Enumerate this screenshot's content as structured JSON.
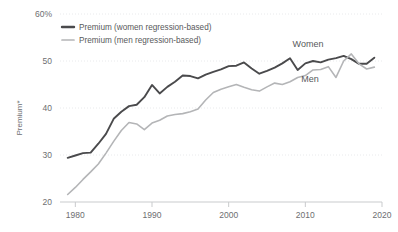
{
  "chart_data": {
    "type": "line",
    "title": "",
    "xlabel": "",
    "ylabel": "Premium*",
    "xlim": [
      1979,
      2020
    ],
    "ylim": [
      20,
      60
    ],
    "grid": true,
    "legend_position": "top-left",
    "y_ticks": [
      "60%",
      "50",
      "40",
      "30",
      "20"
    ],
    "y_tick_values": [
      60,
      50,
      40,
      30,
      20
    ],
    "x_ticks": [
      "1980",
      "1990",
      "2000",
      "2010",
      "2020"
    ],
    "x_tick_values": [
      1980,
      1990,
      2000,
      2010,
      2020
    ],
    "colors": {
      "women": "#4a4a4c",
      "men": "#b4b5b7"
    },
    "x": [
      1979,
      1980,
      1981,
      1982,
      1983,
      1984,
      1985,
      1986,
      1987,
      1988,
      1989,
      1990,
      1991,
      1992,
      1993,
      1994,
      1995,
      1996,
      1997,
      1998,
      1999,
      2000,
      2001,
      2002,
      2003,
      2004,
      2005,
      2006,
      2007,
      2008,
      2009,
      2010,
      2011,
      2012,
      2013,
      2014,
      2015,
      2016,
      2017,
      2018,
      2019
    ],
    "series": [
      {
        "name": "Premium (women regression-based)",
        "inline_label": "Women",
        "color": "#4a4a4c",
        "values": [
          29.4,
          29.9,
          30.4,
          30.5,
          32.4,
          34.5,
          37.7,
          39.2,
          40.4,
          40.7,
          42.3,
          44.9,
          43.1,
          44.5,
          45.6,
          46.9,
          46.8,
          46.3,
          47.1,
          47.7,
          48.2,
          48.9,
          49.0,
          49.7,
          48.4,
          47.3,
          47.9,
          48.6,
          49.5,
          50.6,
          48.1,
          49.5,
          50.0,
          49.7,
          50.3,
          50.6,
          51.1,
          50.4,
          49.4,
          49.4,
          50.7
        ]
      },
      {
        "name": "Premium (men regression-based)",
        "inline_label": "Men",
        "color": "#b4b5b7",
        "values": [
          21.6,
          23.1,
          24.8,
          26.4,
          28.1,
          30.4,
          32.9,
          35.2,
          36.9,
          36.6,
          35.4,
          36.8,
          37.4,
          38.3,
          38.6,
          38.8,
          39.2,
          39.8,
          41.7,
          43.3,
          44.0,
          44.5,
          45.0,
          44.4,
          43.9,
          43.6,
          44.5,
          45.3,
          45.0,
          45.6,
          46.5,
          46.9,
          48.1,
          48.2,
          48.8,
          46.5,
          50.0,
          51.5,
          49.4,
          48.3,
          48.7
        ]
      }
    ]
  }
}
